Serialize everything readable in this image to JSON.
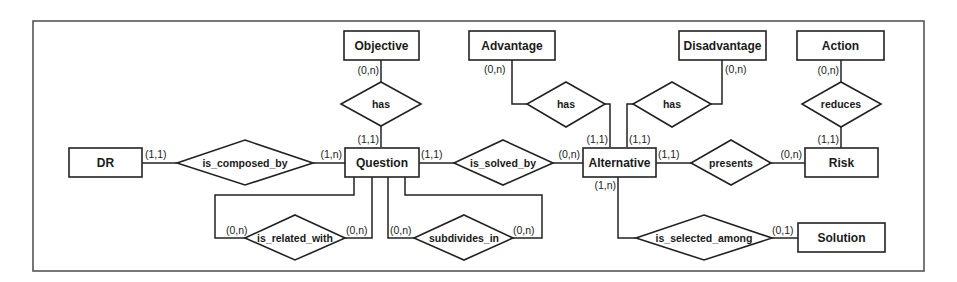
{
  "diagram": {
    "type": "entity-relationship",
    "colors": {
      "stroke": "#222222",
      "frame": "#555555",
      "background": "#ffffff",
      "text": "#1a1a1a"
    },
    "entities": {
      "objective": "Objective",
      "advantage": "Advantage",
      "disadvantage": "Disadvantage",
      "action": "Action",
      "dr": "DR",
      "question": "Question",
      "alternative": "Alternative",
      "risk": "Risk",
      "solution": "Solution"
    },
    "relationships": {
      "objective_has": "has",
      "advantage_has": "has",
      "disadvantage_has": "has",
      "reduces": "reduces",
      "is_composed_by": "is_composed_by",
      "is_solved_by": "is_solved_by",
      "presents": "presents",
      "is_related_with": "is_related_with",
      "subdivides_in": "subdivides_in",
      "is_selected_among": "is_selected_among"
    },
    "cardinalities": {
      "objective_side": "(0,n)",
      "question_objective_side": "(1,1)",
      "advantage_side": "(0,n)",
      "alternative_advantage_side": "(1,1)",
      "disadvantage_side": "(0,n)",
      "alternative_disadvantage_side": "(1,1)",
      "action_side": "(0,n)",
      "risk_action_side": "(1,1)",
      "dr_side": "(1,1)",
      "question_dr_side": "(1,n)",
      "question_solved_side": "(1,1)",
      "alternative_solved_side": "(0,n)",
      "alternative_presents_side": "(1,1)",
      "risk_presents_side": "(0,n)",
      "related_left": "(0,n)",
      "related_right": "(0,n)",
      "subdivides_left": "(0,n)",
      "subdivides_right": "(0,n)",
      "alternative_selected_side": "(1,n)",
      "solution_selected_side": "(0,1)"
    },
    "edges": [
      {
        "from": "Objective",
        "to": "Question",
        "via": "has",
        "cardinality_from": "(0,n)",
        "cardinality_to": "(1,1)"
      },
      {
        "from": "Advantage",
        "to": "Alternative",
        "via": "has",
        "cardinality_from": "(0,n)",
        "cardinality_to": "(1,1)"
      },
      {
        "from": "Disadvantage",
        "to": "Alternative",
        "via": "has",
        "cardinality_from": "(0,n)",
        "cardinality_to": "(1,1)"
      },
      {
        "from": "Action",
        "to": "Risk",
        "via": "reduces",
        "cardinality_from": "(0,n)",
        "cardinality_to": "(1,1)"
      },
      {
        "from": "DR",
        "to": "Question",
        "via": "is_composed_by",
        "cardinality_from": "(1,1)",
        "cardinality_to": "(1,n)"
      },
      {
        "from": "Question",
        "to": "Alternative",
        "via": "is_solved_by",
        "cardinality_from": "(1,1)",
        "cardinality_to": "(0,n)"
      },
      {
        "from": "Alternative",
        "to": "Risk",
        "via": "presents",
        "cardinality_from": "(1,1)",
        "cardinality_to": "(0,n)"
      },
      {
        "from": "Question",
        "to": "Question",
        "via": "is_related_with",
        "cardinality_from": "(0,n)",
        "cardinality_to": "(0,n)"
      },
      {
        "from": "Question",
        "to": "Question",
        "via": "subdivides_in",
        "cardinality_from": "(0,n)",
        "cardinality_to": "(0,n)"
      },
      {
        "from": "Alternative",
        "to": "Solution",
        "via": "is_selected_among",
        "cardinality_from": "(1,n)",
        "cardinality_to": "(0,1)"
      }
    ]
  }
}
